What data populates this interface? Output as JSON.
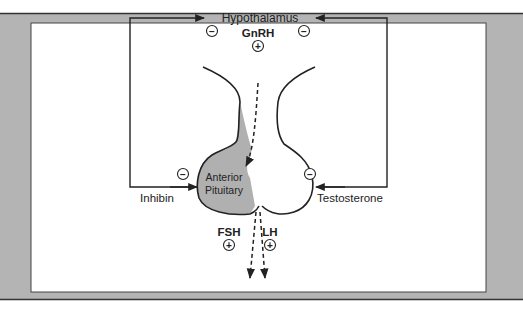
{
  "diagram": {
    "nodes": {
      "hypothalamus": "Hypothalamus",
      "gnrh": "GnRH",
      "anterior_pituitary_line1": "Anterior",
      "anterior_pituitary_line2": "Pituitary",
      "fsh": "FSH",
      "lh": "LH",
      "inhibin": "Inhibin",
      "testosterone": "Testosterone"
    },
    "signs": {
      "positive": "+",
      "negative": "−"
    },
    "edges": [
      {
        "from": "Hypothalamus",
        "to": "Anterior Pituitary",
        "via": "GnRH",
        "effect": "+"
      },
      {
        "from": "Anterior Pituitary",
        "to": "out",
        "via": "FSH",
        "effect": "+"
      },
      {
        "from": "Anterior Pituitary",
        "to": "out",
        "via": "LH",
        "effect": "+"
      },
      {
        "from": "Inhibin",
        "to": "Hypothalamus",
        "effect": "-"
      },
      {
        "from": "Inhibin",
        "to": "Anterior Pituitary",
        "effect": "-"
      },
      {
        "from": "Testosterone",
        "to": "Hypothalamus",
        "effect": "-"
      },
      {
        "from": "Testosterone",
        "to": "Anterior Pituitary",
        "effect": "-"
      }
    ],
    "colors": {
      "frame_gray": "#b4b4b4",
      "line": "#222222",
      "pituitary_fill": "#b0b0b0"
    }
  }
}
